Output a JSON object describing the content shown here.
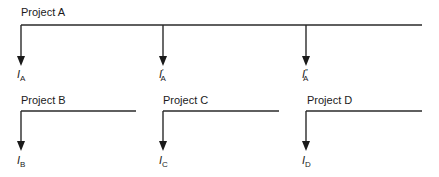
{
  "diagram": {
    "type": "cash-flow-diagram",
    "projects": [
      {
        "name": "Project A",
        "outflows": [
          {
            "symbol": "I",
            "prime": "",
            "subscript": "A"
          },
          {
            "symbol": "I",
            "prime": "′",
            "subscript": "A"
          },
          {
            "symbol": "I",
            "prime": "″",
            "subscript": "A"
          }
        ]
      },
      {
        "name": "Project B",
        "outflows": [
          {
            "symbol": "I",
            "prime": "",
            "subscript": "B"
          }
        ]
      },
      {
        "name": "Project C",
        "outflows": [
          {
            "symbol": "I",
            "prime": "",
            "subscript": "C"
          }
        ]
      },
      {
        "name": "Project D",
        "outflows": [
          {
            "symbol": "I",
            "prime": "",
            "subscript": "D"
          }
        ]
      }
    ]
  }
}
